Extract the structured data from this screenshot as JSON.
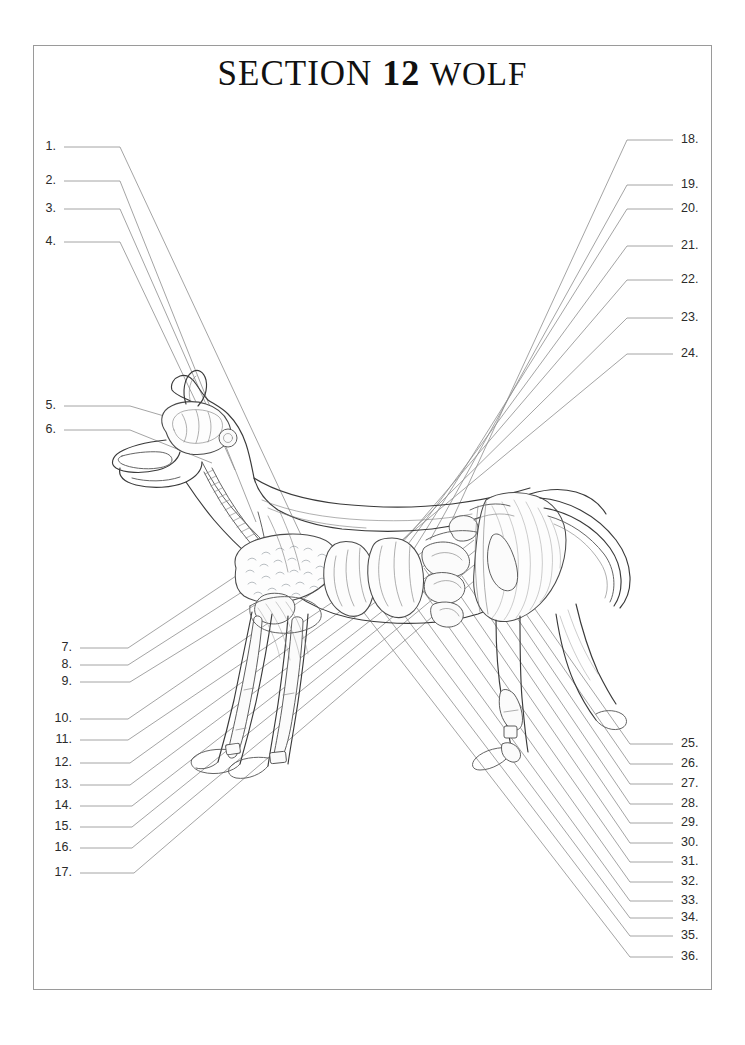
{
  "page": {
    "title_prefix": "SECTION",
    "title_number": "12",
    "title_subject": "WOLF",
    "border_color": "#9a9a9a",
    "text_color": "#2b2b2b",
    "leader_color": "#8d8d8d",
    "background": "#ffffff"
  },
  "diagram": {
    "name": "wolf-anatomy-diagram"
  },
  "labels": {
    "left_upper": [
      {
        "n": "1.",
        "x": 56,
        "y": 147,
        "line_end_x": 120,
        "bend_x": 120,
        "tip_x": 315,
        "tip_y": 565
      },
      {
        "n": "2.",
        "x": 56,
        "y": 181,
        "line_end_x": 120,
        "bend_x": 120,
        "tip_x": 256,
        "tip_y": 522
      },
      {
        "n": "3.",
        "x": 56,
        "y": 209,
        "line_end_x": 120,
        "bend_x": 120,
        "tip_x": 235,
        "tip_y": 470
      },
      {
        "n": "4.",
        "x": 56,
        "y": 242,
        "line_end_x": 120,
        "bend_x": 120,
        "tip_x": 214,
        "tip_y": 440
      }
    ],
    "left_head": [
      {
        "n": "5.",
        "x": 56,
        "y": 406,
        "line_end_x": 130,
        "bend_x": 130,
        "tip_x": 205,
        "tip_y": 428
      },
      {
        "n": "6.",
        "x": 56,
        "y": 430,
        "line_end_x": 130,
        "bend_x": 130,
        "tip_x": 212,
        "tip_y": 463
      }
    ],
    "left_lower": [
      {
        "n": "7.",
        "x": 72,
        "y": 648,
        "bend_x": 128,
        "tip_x": 266,
        "tip_y": 556
      },
      {
        "n": "8.",
        "x": 72,
        "y": 665,
        "bend_x": 128,
        "tip_x": 292,
        "tip_y": 560
      },
      {
        "n": "9.",
        "x": 72,
        "y": 682,
        "bend_x": 130,
        "tip_x": 318,
        "tip_y": 566
      },
      {
        "n": "10.",
        "x": 72,
        "y": 719,
        "bend_x": 128,
        "tip_x": 372,
        "tip_y": 552
      },
      {
        "n": "11.",
        "x": 72,
        "y": 740,
        "bend_x": 128,
        "tip_x": 401,
        "tip_y": 556
      },
      {
        "n": "12.",
        "x": 72,
        "y": 763,
        "bend_x": 130,
        "tip_x": 428,
        "tip_y": 548
      },
      {
        "n": "13.",
        "x": 72,
        "y": 785,
        "bend_x": 130,
        "tip_x": 452,
        "tip_y": 545
      },
      {
        "n": "14.",
        "x": 72,
        "y": 806,
        "bend_x": 132,
        "tip_x": 474,
        "tip_y": 540
      },
      {
        "n": "15.",
        "x": 72,
        "y": 827,
        "bend_x": 132,
        "tip_x": 497,
        "tip_y": 533
      },
      {
        "n": "16.",
        "x": 72,
        "y": 848,
        "bend_x": 132,
        "tip_x": 520,
        "tip_y": 527
      },
      {
        "n": "17.",
        "x": 72,
        "y": 873,
        "bend_x": 134,
        "tip_x": 545,
        "tip_y": 520
      }
    ],
    "right_upper": [
      {
        "n": "18.",
        "x": 681,
        "y": 140,
        "bend_x": 627,
        "tip_x": 452,
        "tip_y": 520
      },
      {
        "n": "19.",
        "x": 681,
        "y": 185,
        "bend_x": 627,
        "tip_x": 430,
        "tip_y": 540
      },
      {
        "n": "20.",
        "x": 681,
        "y": 209,
        "bend_x": 627,
        "tip_x": 412,
        "tip_y": 552
      },
      {
        "n": "21.",
        "x": 681,
        "y": 246,
        "bend_x": 627,
        "tip_x": 392,
        "tip_y": 566
      },
      {
        "n": "22.",
        "x": 681,
        "y": 280,
        "bend_x": 627,
        "tip_x": 372,
        "tip_y": 578
      },
      {
        "n": "23.",
        "x": 681,
        "y": 318,
        "bend_x": 627,
        "tip_x": 352,
        "tip_y": 590
      },
      {
        "n": "24.",
        "x": 681,
        "y": 354,
        "bend_x": 627,
        "tip_x": 330,
        "tip_y": 600
      }
    ],
    "right_lower": [
      {
        "n": "25.",
        "x": 681,
        "y": 744,
        "bend_x": 630,
        "tip_x": 523,
        "tip_y": 592
      },
      {
        "n": "26.",
        "x": 681,
        "y": 764,
        "bend_x": 630,
        "tip_x": 508,
        "tip_y": 588
      },
      {
        "n": "27.",
        "x": 681,
        "y": 784,
        "bend_x": 630,
        "tip_x": 494,
        "tip_y": 584
      },
      {
        "n": "28.",
        "x": 681,
        "y": 804,
        "bend_x": 630,
        "tip_x": 478,
        "tip_y": 580
      },
      {
        "n": "29.",
        "x": 681,
        "y": 823,
        "bend_x": 630,
        "tip_x": 462,
        "tip_y": 576
      },
      {
        "n": "30.",
        "x": 681,
        "y": 843,
        "bend_x": 630,
        "tip_x": 444,
        "tip_y": 572
      },
      {
        "n": "31.",
        "x": 681,
        "y": 862,
        "bend_x": 630,
        "tip_x": 424,
        "tip_y": 568
      },
      {
        "n": "32.",
        "x": 681,
        "y": 882,
        "bend_x": 630,
        "tip_x": 404,
        "tip_y": 564
      },
      {
        "n": "33.",
        "x": 681,
        "y": 901,
        "bend_x": 630,
        "tip_x": 382,
        "tip_y": 560
      },
      {
        "n": "34.",
        "x": 681,
        "y": 918,
        "bend_x": 630,
        "tip_x": 360,
        "tip_y": 556
      },
      {
        "n": "35.",
        "x": 681,
        "y": 936,
        "bend_x": 630,
        "tip_x": 338,
        "tip_y": 552
      },
      {
        "n": "36.",
        "x": 681,
        "y": 957,
        "bend_x": 630,
        "tip_x": 314,
        "tip_y": 548
      }
    ]
  }
}
